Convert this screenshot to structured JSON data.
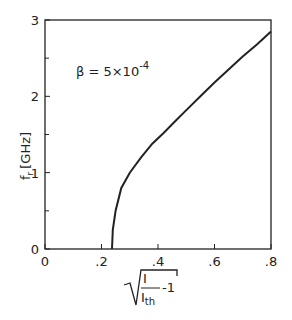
{
  "chart_data": {
    "type": "line",
    "title": "",
    "xlabel": "sqrt(I / I_th - 1)",
    "ylabel": "f_r [GHz]",
    "xlim": [
      0,
      0.8
    ],
    "ylim": [
      0,
      3
    ],
    "x_ticks": [
      "0",
      ".2",
      ".4",
      ".6",
      ".8"
    ],
    "y_ticks": [
      "0",
      "1",
      "2",
      "3"
    ],
    "grid": false,
    "legend": null,
    "annotations": [
      "β = 5×10^-4"
    ],
    "series": [
      {
        "name": "f_r",
        "x": [
          0.237,
          0.24,
          0.25,
          0.27,
          0.3,
          0.34,
          0.38,
          0.42,
          0.46,
          0.5,
          0.55,
          0.6,
          0.65,
          0.7,
          0.75,
          0.8
        ],
        "y": [
          0.0,
          0.25,
          0.5,
          0.8,
          1.0,
          1.2,
          1.38,
          1.52,
          1.67,
          1.82,
          2.0,
          2.18,
          2.35,
          2.52,
          2.68,
          2.85
        ]
      }
    ]
  },
  "labels": {
    "ylabel_main": "f",
    "ylabel_sub": "r",
    "ylabel_unit": "[GHz]",
    "annotation_beta": "β = 5×10",
    "annotation_exp": "-4",
    "x_frac_num": "I",
    "x_frac_den": "I",
    "x_frac_den_sub": "th",
    "x_minus": "-1"
  }
}
